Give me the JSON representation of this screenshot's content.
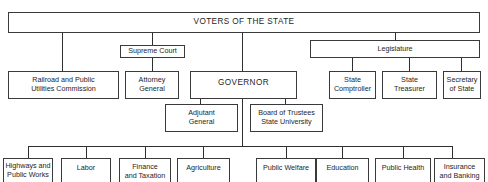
{
  "diagram": {
    "type": "organizational-chart",
    "root": {
      "label": "VOTERS OF THE STATE"
    },
    "level1_intermediate": {
      "supreme_court": {
        "label": "Supreme Court"
      },
      "legislature": {
        "label": "Legislature"
      }
    },
    "level2": {
      "railroad": {
        "label": "Railroad and Public\nUtilities Commission"
      },
      "attorney_general": {
        "label": "Attorney\nGeneral"
      },
      "governor": {
        "label": "GOVERNOR"
      },
      "state_comptroller": {
        "label": "State\nComptroller"
      },
      "state_treasurer": {
        "label": "State\nTreasurer"
      },
      "secretary_of_state": {
        "label": "Secretary\nof State"
      }
    },
    "governor_direct": {
      "adjutant_general": {
        "label": "Adjutant\nGeneral"
      },
      "board_of_trustees": {
        "label": "Board of Trustees\nState University"
      }
    },
    "departments": [
      {
        "label": "Highways and\nPublic Works"
      },
      {
        "label": "Labor"
      },
      {
        "label": "Finance\nand Taxation"
      },
      {
        "label": "Agriculture"
      },
      {
        "label": "Public Welfare"
      },
      {
        "label": "Education"
      },
      {
        "label": "Public Health"
      },
      {
        "label": "Insurance\nand Banking"
      }
    ],
    "edges": [
      [
        "VOTERS OF THE STATE",
        "Railroad and Public Utilities Commission"
      ],
      [
        "VOTERS OF THE STATE",
        "Supreme Court"
      ],
      [
        "Supreme Court",
        "Attorney General"
      ],
      [
        "VOTERS OF THE STATE",
        "GOVERNOR"
      ],
      [
        "VOTERS OF THE STATE",
        "Legislature"
      ],
      [
        "Legislature",
        "State Comptroller"
      ],
      [
        "Legislature",
        "State Treasurer"
      ],
      [
        "Legislature",
        "Secretary of State"
      ],
      [
        "GOVERNOR",
        "Adjutant General"
      ],
      [
        "GOVERNOR",
        "Board of Trustees State University"
      ],
      [
        "GOVERNOR",
        "Highways and Public Works"
      ],
      [
        "GOVERNOR",
        "Labor"
      ],
      [
        "GOVERNOR",
        "Finance and Taxation"
      ],
      [
        "GOVERNOR",
        "Agriculture"
      ],
      [
        "GOVERNOR",
        "Public Welfare"
      ],
      [
        "GOVERNOR",
        "Education"
      ],
      [
        "GOVERNOR",
        "Public Health"
      ],
      [
        "GOVERNOR",
        "Insurance and Banking"
      ]
    ]
  }
}
